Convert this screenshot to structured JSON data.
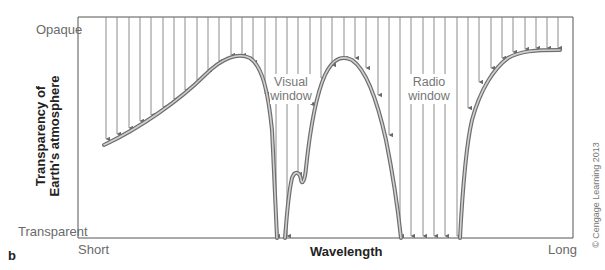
{
  "figure": {
    "panel_label": "b",
    "y_axis": {
      "title_line1": "Transparency of",
      "title_line2": "Earth's atmosphere",
      "top_label": "Opaque",
      "bottom_label": "Transparent"
    },
    "x_axis": {
      "title": "Wavelength",
      "left_label": "Short",
      "right_label": "Long"
    },
    "annotations": {
      "visual_window_line1": "Visual",
      "visual_window_line2": "window",
      "radio_window_line1": "Radio",
      "radio_window_line2": "window"
    },
    "credit": "© Cengage Learning 2013",
    "colors": {
      "curve_outline": "#6e6e6e",
      "curve_fill": "#c9c9c9",
      "arrows": "#7a7a7a",
      "frame": "#555555"
    }
  }
}
